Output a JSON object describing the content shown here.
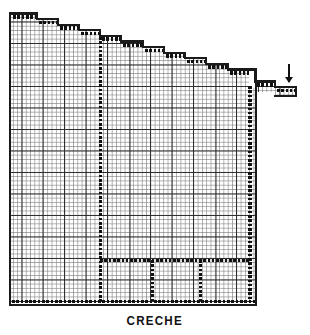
{
  "drawing": {
    "caption": "CRECHE",
    "type": "architectural-floor-plan",
    "medium": "graph-paper",
    "grid": {
      "minor_cell_px": 4.3,
      "major_cell_px": 21.5,
      "major_every_n_minor": 5,
      "minor_color": "#787878",
      "major_color": "#282828"
    },
    "ink_color": "#111111",
    "paper_color": "#ffffff"
  },
  "plan": {
    "outline_note": "stepped / terraced north facade descending left-to-right",
    "left_wall": {
      "x": 11,
      "y_top": 14,
      "y_bottom": 303
    },
    "bottom_wall": {
      "y": 303,
      "x_left": 11,
      "x_right": 256
    },
    "right_wall": {
      "x": 249,
      "y_top": 88,
      "y_bottom": 303
    },
    "steps": [
      {
        "x_start": 11,
        "x_end": 37,
        "y": 14
      },
      {
        "x_start": 37,
        "x_end": 58,
        "y": 19
      },
      {
        "x_start": 58,
        "x_end": 79,
        "y": 25
      },
      {
        "x_start": 79,
        "x_end": 100,
        "y": 30
      },
      {
        "x_start": 100,
        "x_end": 121,
        "y": 36
      },
      {
        "x_start": 121,
        "x_end": 143,
        "y": 41
      },
      {
        "x_start": 143,
        "x_end": 164,
        "y": 47
      },
      {
        "x_start": 164,
        "x_end": 185,
        "y": 52
      },
      {
        "x_start": 185,
        "x_end": 206,
        "y": 58
      },
      {
        "x_start": 206,
        "x_end": 228,
        "y": 63
      },
      {
        "x_start": 228,
        "x_end": 249,
        "y": 69
      },
      {
        "x_start": 249,
        "x_end": 256,
        "y": 88
      }
    ],
    "entrance_steps": [
      {
        "x_start": 256,
        "x_end": 275,
        "y": 82
      },
      {
        "x_start": 275,
        "x_end": 294,
        "y": 88
      },
      {
        "x_start": 294,
        "x_end": 297,
        "y": 95
      }
    ],
    "partitions": {
      "main_vertical": {
        "x": 100,
        "y_top": 36,
        "y_bottom": 303,
        "style": "dotted"
      },
      "lower_horizontal": {
        "y": 260,
        "x_left": 100,
        "x_right": 249,
        "style": "dotted"
      },
      "room_divider_1": {
        "x": 152,
        "y_top": 260,
        "y_bottom": 303,
        "style": "dotted"
      },
      "room_divider_2": {
        "x": 200,
        "y_top": 260,
        "y_bottom": 303,
        "style": "dotted"
      }
    },
    "entrance_arrow": {
      "label": "entrance-arrow",
      "direction": "down",
      "x": 289,
      "y": 62
    }
  }
}
